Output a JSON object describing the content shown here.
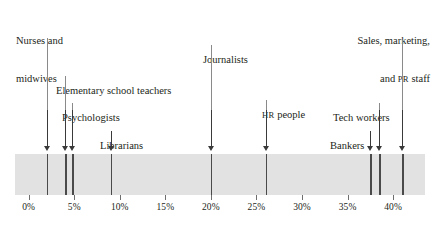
{
  "chart_data": {
    "type": "scatter",
    "title": "",
    "xlabel": "",
    "ylabel": "",
    "xlim": [
      -1.5,
      43.5
    ],
    "grid": false,
    "legend": null,
    "tick_labels": [
      "0%",
      "5%",
      "10%",
      "15%",
      "20%",
      "25%",
      "30%",
      "35%",
      "40%"
    ],
    "tick_values": [
      0,
      5,
      10,
      15,
      20,
      25,
      30,
      35,
      40
    ],
    "categories": [
      "Nurses and midwives",
      "Elementary school teachers",
      "Psychologists",
      "Librarians",
      "Journalists",
      "HR people",
      "Bankers",
      "Tech workers",
      "Sales, marketing, and PR staff"
    ],
    "values": [
      2.0,
      4.0,
      4.8,
      9.0,
      20.0,
      26.0,
      37.5,
      38.5,
      41.0
    ]
  },
  "annotations": [
    {
      "id": "nurses",
      "line1": "Nurses and",
      "line2": "midwives",
      "value": 2.0
    },
    {
      "id": "elementary-school-teachers",
      "line1": "Elementary school teachers",
      "line2": "",
      "value": 4.0
    },
    {
      "id": "psychologists",
      "line1": "Psychologists",
      "line2": "",
      "value": 4.8
    },
    {
      "id": "librarians",
      "line1": "Librarians",
      "line2": "",
      "value": 9.0
    },
    {
      "id": "journalists",
      "line1": "Journalists",
      "line2": "",
      "value": 20.0
    },
    {
      "id": "hr-people",
      "line1_smallcaps": "HR",
      "line1": " people",
      "line2": "",
      "value": 26.0
    },
    {
      "id": "bankers",
      "line1": "Bankers",
      "line2": "",
      "value": 37.5
    },
    {
      "id": "tech-workers",
      "line1": "Tech workers",
      "line2": "",
      "value": 38.5
    },
    {
      "id": "sales-marketing-pr",
      "line1": "Sales, marketing,",
      "line2_prefix": "and ",
      "line2_smallcaps": "PR",
      "line2_suffix": " staff",
      "value": 41.0
    }
  ],
  "colors": {
    "band": "#e2e2e2",
    "rug": "#4a4a4a",
    "text": "#231f20",
    "leader": "#8a8a8a",
    "arrow": "#3a3a3a"
  }
}
